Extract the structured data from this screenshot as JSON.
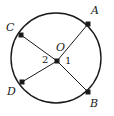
{
  "figure": {
    "type": "circle-geometry-diagram",
    "background_color": "#ffffff",
    "stroke_color": "#1a1a1a",
    "canvas": {
      "width": 114,
      "height": 116
    }
  },
  "circle": {
    "label": "circle",
    "center_x": 56,
    "center_y": 58,
    "radius": 45,
    "stroke_width": 1.4
  },
  "center_point": {
    "label": "O",
    "x": 57,
    "y": 61,
    "label_x": 56,
    "label_y": 42,
    "dot_size": 5
  },
  "points": [
    {
      "id": "A",
      "label": "A",
      "x": 88,
      "y": 24,
      "label_x": 91,
      "label_y": 5,
      "dot_size": 5
    },
    {
      "id": "C",
      "label": "C",
      "x": 21,
      "y": 35,
      "label_x": 6,
      "label_y": 22,
      "dot_size": 5
    },
    {
      "id": "D",
      "label": "D",
      "x": 22,
      "y": 82,
      "label_x": 7,
      "label_y": 86,
      "dot_size": 5
    },
    {
      "id": "B",
      "label": "B",
      "x": 88,
      "y": 92,
      "label_x": 90,
      "label_y": 98,
      "dot_size": 5
    }
  ],
  "segments": [
    {
      "id": "OA",
      "from": "O",
      "to": "A",
      "x1": 57,
      "y1": 61,
      "x2": 88,
      "y2": 24
    },
    {
      "id": "OC",
      "from": "O",
      "to": "C",
      "x1": 57,
      "y1": 61,
      "x2": 21,
      "y2": 35
    },
    {
      "id": "OD",
      "from": "O",
      "to": "D",
      "x1": 57,
      "y1": 61,
      "x2": 22,
      "y2": 82
    },
    {
      "id": "OB",
      "from": "O",
      "to": "B",
      "x1": 57,
      "y1": 61,
      "x2": 88,
      "y2": 92
    }
  ],
  "angle_labels": [
    {
      "id": "angle-1",
      "label": "1",
      "x": 65,
      "y": 56
    },
    {
      "id": "angle-2",
      "label": "2",
      "x": 42,
      "y": 55
    }
  ]
}
